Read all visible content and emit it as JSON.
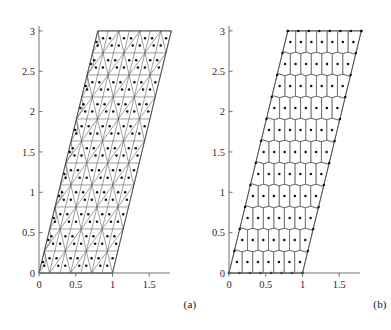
{
  "figure": {
    "panels": [
      {
        "id": "a",
        "caption": "(a)",
        "kind": "triangular-mesh",
        "name": "triangular mesh on sheared parallelogram domain"
      },
      {
        "id": "b",
        "caption": "(b)",
        "kind": "polygonal-voronoi-mesh",
        "name": "polygonal (Voronoi dual) mesh on sheared parallelogram domain"
      }
    ]
  },
  "chart_data": {
    "type": "diagram",
    "title": "",
    "subtitle": "",
    "xlabel": "",
    "ylabel": "",
    "grid": false,
    "legend": "none",
    "xlim": [
      -0.1,
      1.85
    ],
    "ylim": [
      -0.12,
      3.12
    ],
    "xticks": [
      0,
      0.5,
      1,
      1.5
    ],
    "xticklabels": [
      "0",
      "0.5",
      "1",
      "1.5"
    ],
    "yticks": [
      0,
      0.5,
      1,
      1.5,
      2,
      2.5,
      3
    ],
    "yticklabels": [
      "0",
      "0.5",
      "1",
      "1.5",
      "2",
      "2.5",
      "3"
    ],
    "domain_polygon": [
      [
        0,
        0
      ],
      [
        1,
        0
      ],
      [
        1.8,
        3
      ],
      [
        0.8,
        3
      ]
    ],
    "shear_per_unit_y": 0.2667,
    "mesh": {
      "rows": 11,
      "cols_per_row": 7,
      "dx": 0.1667,
      "dy": 0.2727,
      "triangle_count": 132,
      "cell_center_marker": "dot",
      "marker_size_px": 1.6
    },
    "series": [
      {
        "name": "mesh-edges-panel-a",
        "kind": "triangulation",
        "stroke": "#4d4d4d"
      },
      {
        "name": "cell-centroids-panel-a",
        "kind": "scatter",
        "marker": "dot",
        "fill": "#111111"
      },
      {
        "name": "voronoi-edges-panel-b",
        "kind": "polygon-tessellation",
        "stroke": "#4d4d4d"
      },
      {
        "name": "generator-points-panel-b",
        "kind": "scatter",
        "marker": "dot",
        "fill": "#111111"
      }
    ]
  },
  "colors": {
    "background": "#ffffff",
    "axis": "#6f6f6f",
    "mesh": "#4d4d4d",
    "border": "#3a3a3a",
    "marker": "#111111",
    "text": "#1a1a1a"
  }
}
